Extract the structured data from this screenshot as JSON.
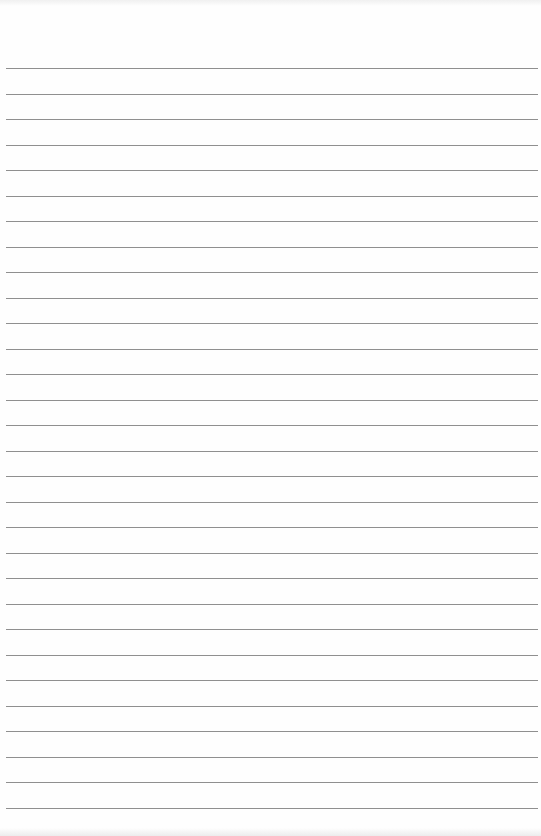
{
  "page": {
    "type": "lined-paper",
    "background_color": "#fefefe",
    "line_color": "#8f8f8f",
    "line_count": 30,
    "first_line_y": 68,
    "line_spacing": 25.5,
    "line_left": 6,
    "line_width": 532
  }
}
